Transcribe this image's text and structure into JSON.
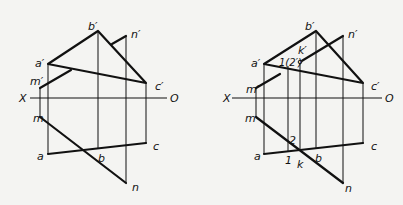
{
  "diagrams": [
    {
      "id": "left",
      "labels": {
        "a_prime": "a′",
        "b_prime": "b′",
        "c_prime": "c′",
        "m_prime": "m′",
        "n_prime": "n′",
        "a": "a",
        "b": "b",
        "c": "c",
        "m": "m",
        "n": "n",
        "X": "X",
        "O": "O"
      }
    },
    {
      "id": "right",
      "labels": {
        "a_prime": "a′",
        "b_prime": "b′",
        "c_prime": "c′",
        "m_prime": "m′",
        "n_prime": "n′",
        "k_prime": "k′",
        "overlap": "1(2′)",
        "a": "a",
        "b": "b",
        "c": "c",
        "m": "m",
        "n": "n",
        "k": "k",
        "p1": "1",
        "p2": "2",
        "X": "X",
        "O": "O"
      }
    }
  ],
  "colors": {
    "line": "#111111",
    "background": "#f4f4f2"
  }
}
